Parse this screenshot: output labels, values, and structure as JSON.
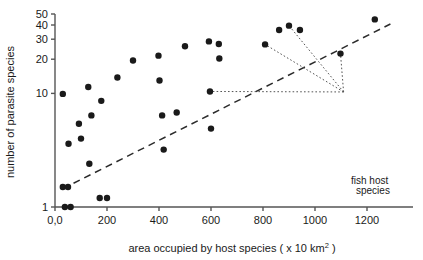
{
  "chart_data": {
    "type": "scatter",
    "title": "",
    "xlabel": "area occupied by host species ( x 10 km2 )",
    "xlabel_main": "area occupied by host species ( x 10 km",
    "xlabel_sup": "2",
    "xlabel_tail": " )",
    "ylabel": "number of parasite species",
    "xscale": "linear",
    "yscale": "log",
    "xlim": [
      0,
      1300
    ],
    "ylim": [
      1,
      50
    ],
    "grid": false,
    "legend": false,
    "xticks": [
      0,
      200,
      400,
      600,
      800,
      1000,
      1200
    ],
    "xtick_labels": [
      "0,0",
      "200",
      "400",
      "600",
      "800",
      "1000",
      "1200"
    ],
    "yticks": [
      1,
      10,
      20,
      30,
      40,
      50
    ],
    "ytick_labels": [
      "1",
      "10",
      "20",
      "30",
      "40",
      "50"
    ],
    "points": [
      {
        "x": 30,
        "y": 1.5
      },
      {
        "x": 30,
        "y": 9.9
      },
      {
        "x": 38,
        "y": 1.0
      },
      {
        "x": 50,
        "y": 1.5
      },
      {
        "x": 52,
        "y": 3.6
      },
      {
        "x": 60,
        "y": 1.0
      },
      {
        "x": 92,
        "y": 5.4
      },
      {
        "x": 100,
        "y": 4.0
      },
      {
        "x": 128,
        "y": 11.4
      },
      {
        "x": 132,
        "y": 2.4
      },
      {
        "x": 140,
        "y": 6.4
      },
      {
        "x": 172,
        "y": 1.2
      },
      {
        "x": 178,
        "y": 8.6
      },
      {
        "x": 200,
        "y": 1.2
      },
      {
        "x": 240,
        "y": 13.8
      },
      {
        "x": 300,
        "y": 19.5
      },
      {
        "x": 398,
        "y": 21.5
      },
      {
        "x": 402,
        "y": 13.0
      },
      {
        "x": 412,
        "y": 6.4
      },
      {
        "x": 418,
        "y": 3.2
      },
      {
        "x": 468,
        "y": 6.8
      },
      {
        "x": 500,
        "y": 26.0
      },
      {
        "x": 592,
        "y": 28.7
      },
      {
        "x": 596,
        "y": 10.4
      },
      {
        "x": 600,
        "y": 4.9
      },
      {
        "x": 630,
        "y": 27.2
      },
      {
        "x": 632,
        "y": 20.3
      },
      {
        "x": 808,
        "y": 27.0
      },
      {
        "x": 862,
        "y": 36.2
      },
      {
        "x": 900,
        "y": 39.5
      },
      {
        "x": 942,
        "y": 36.2
      },
      {
        "x": 1098,
        "y": 22.4
      },
      {
        "x": 1230,
        "y": 44.8
      }
    ],
    "trendline": {
      "style": "dashed",
      "x1": 30,
      "y1": 1.45,
      "x2": 1290,
      "y2": 40.8
    },
    "annotations": [
      {
        "id": "fish-host-species",
        "text_line1": "fish host",
        "text_line2": "species",
        "anchor": {
          "x": 1110,
          "y": 10.3
        },
        "targets": [
          {
            "x": 596,
            "y": 10.4
          },
          {
            "x": 808,
            "y": 27.0
          },
          {
            "x": 900,
            "y": 39.5
          },
          {
            "x": 1098,
            "y": 22.4
          }
        ],
        "style": "dotted"
      }
    ]
  },
  "marker": {
    "shape": "circle",
    "color": "#1a1a1a",
    "radius_px": 3.2
  },
  "colors": {
    "axis": "#555555",
    "marker": "#1a1a1a",
    "trendline": "#2b2b2b",
    "annotation_line": "#555555",
    "background": "#ffffff",
    "text": "#1a1a1a"
  }
}
